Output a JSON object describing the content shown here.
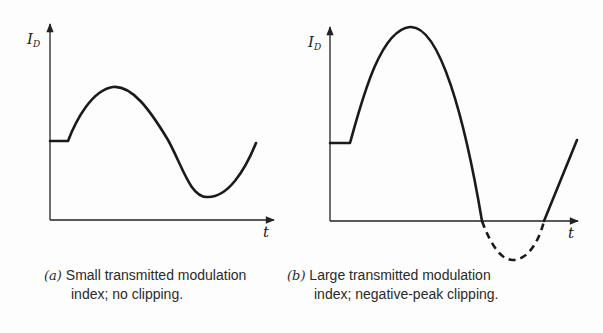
{
  "panels": [
    {
      "id": "a",
      "y_axis_label": "I",
      "y_axis_subscript": "D",
      "x_axis_label": "t",
      "caption_tag": "(a)",
      "caption_line1": "Small transmitted modulation",
      "caption_line2": "index; no clipping."
    },
    {
      "id": "b",
      "y_axis_label": "I",
      "y_axis_subscript": "D",
      "x_axis_label": "t",
      "caption_tag": "(b)",
      "caption_line1": "Large transmitted modulation",
      "caption_line2": "index; negative-peak clipping."
    }
  ],
  "colors": {
    "line": "#1a1a1a",
    "background": "#fdfdfd"
  }
}
